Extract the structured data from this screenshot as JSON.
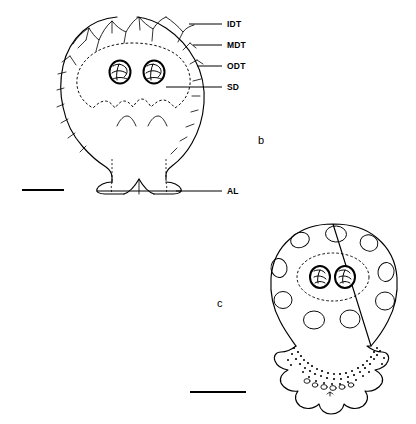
{
  "figure": {
    "panels": [
      {
        "letter": "b",
        "letter_x": 258,
        "letter_y": 144,
        "description": "Ovoid body with crenulate apex, radial trichomes, dashed subsidiary dome enclosing two stomata, basal lobes"
      },
      {
        "letter": "c",
        "letter_x": 217,
        "letter_y": 307,
        "description": "Ovoid body with elliptical pits, dashed subsidiary dome enclosing two stomata, frilled and stippled base"
      }
    ],
    "annotations": [
      {
        "key": "IDT",
        "label": "IDT",
        "text_x": 227,
        "text_y": 27,
        "leader_x1": 189,
        "leader_y1": 24,
        "leader_x2": 222,
        "leader_y2": 24
      },
      {
        "key": "MDT",
        "label": "MDT",
        "text_x": 227,
        "text_y": 48,
        "leader_x1": 193,
        "leader_y1": 45,
        "leader_x2": 222,
        "leader_y2": 45
      },
      {
        "key": "ODT",
        "label": "ODT",
        "text_x": 227,
        "text_y": 69,
        "leader_x1": 197,
        "leader_y1": 66,
        "leader_x2": 222,
        "leader_y2": 66
      },
      {
        "key": "SD",
        "label": "SD",
        "text_x": 227,
        "text_y": 90,
        "leader_x1": 166,
        "leader_y1": 87,
        "leader_x2": 222,
        "leader_y2": 87
      },
      {
        "key": "AL",
        "label": "AL",
        "text_x": 227,
        "text_y": 194,
        "leader_x1": 176,
        "leader_y1": 191,
        "leader_x2": 222,
        "leader_y2": 191
      }
    ],
    "scale_bars": [
      {
        "name": "scale-bar-panel-b",
        "x1": 22,
        "y1": 190,
        "x2": 64,
        "y2": 190
      },
      {
        "name": "scale-bar-panel-c",
        "x1": 190,
        "y1": 392,
        "x2": 246,
        "y2": 392
      }
    ],
    "panel_b": {
      "stomata": [
        {
          "cx": 120,
          "cy": 72,
          "rx": 10.5,
          "ry": 11.5
        },
        {
          "cx": 154,
          "cy": 72,
          "rx": 10.5,
          "ry": 11.5
        }
      ]
    },
    "panel_c": {
      "stomata": [
        {
          "cx": 320,
          "cy": 277,
          "rx": 10.0,
          "ry": 11.0
        },
        {
          "cx": 345,
          "cy": 277,
          "rx": 10.0,
          "ry": 11.0
        }
      ],
      "pits": [
        {
          "cx": 300,
          "cy": 240,
          "rx": 9.5,
          "ry": 7.5,
          "rot": -18
        },
        {
          "cx": 336,
          "cy": 234,
          "rx": 10.5,
          "ry": 8.0,
          "rot": 4
        },
        {
          "cx": 369,
          "cy": 243,
          "rx": 9.0,
          "ry": 8.0,
          "rot": 22
        },
        {
          "cx": 279,
          "cy": 268,
          "rx": 8.0,
          "ry": 9.5,
          "rot": -8
        },
        {
          "cx": 386,
          "cy": 272,
          "rx": 8.0,
          "ry": 9.5,
          "rot": 10
        },
        {
          "cx": 283,
          "cy": 300,
          "rx": 9.0,
          "ry": 8.5,
          "rot": 0
        },
        {
          "cx": 385,
          "cy": 301,
          "rx": 9.5,
          "ry": 9.0,
          "rot": 0
        },
        {
          "cx": 314,
          "cy": 320,
          "rx": 10.5,
          "ry": 9.0,
          "rot": 0
        },
        {
          "cx": 350,
          "cy": 319,
          "rx": 10.0,
          "ry": 9.0,
          "rot": 0
        }
      ]
    }
  }
}
